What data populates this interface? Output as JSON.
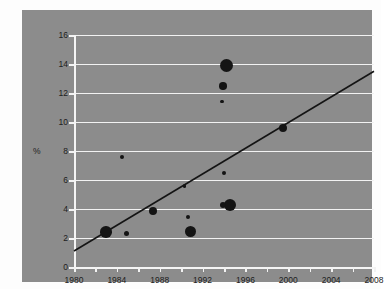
{
  "chart_data": {
    "type": "scatter",
    "title": "",
    "subtitle": "",
    "xlabel": "",
    "ylabel": "%",
    "xlim": [
      1980,
      2008
    ],
    "ylim": [
      0,
      16
    ],
    "xticks": [
      1980,
      1982,
      1984,
      1986,
      1988,
      1990,
      1992,
      1994,
      1996,
      1998,
      2000,
      2002,
      2004,
      2006,
      2008
    ],
    "xtick_labels": [
      "1980",
      "",
      "1984",
      "",
      "1988",
      "",
      "1992",
      "",
      "1996",
      "",
      "2000",
      "",
      "2004",
      "",
      "2008"
    ],
    "yticks": [
      0,
      2,
      4,
      6,
      8,
      10,
      12,
      14,
      16
    ],
    "ytick_labels": [
      "0",
      "2",
      "4",
      "6",
      "8",
      "10",
      "12",
      "14",
      "16"
    ],
    "grid": "horizontal",
    "grid_color": "#f2f2f2",
    "panel_color": "#8c8c8c",
    "marker_color": "#141414",
    "legend": "none",
    "series": [
      {
        "name": "observations",
        "points": [
          {
            "x": 1983.0,
            "y": 2.4,
            "size": 11.5,
            "style": "filled"
          },
          {
            "x": 1984.5,
            "y": 7.6,
            "size": 4.5,
            "style": "filled"
          },
          {
            "x": 1984.9,
            "y": 2.3,
            "size": 5.5,
            "style": "filled"
          },
          {
            "x": 1987.4,
            "y": 3.85,
            "size": 8.0,
            "style": "filled"
          },
          {
            "x": 1990.3,
            "y": 5.6,
            "size": 3.5,
            "style": "filled"
          },
          {
            "x": 1990.6,
            "y": 3.45,
            "size": 4.0,
            "style": "filled"
          },
          {
            "x": 1990.9,
            "y": 2.45,
            "size": 11.0,
            "style": "filled"
          },
          {
            "x": 1994.2,
            "y": 13.9,
            "size": 13.0,
            "style": "filled"
          },
          {
            "x": 1993.9,
            "y": 12.5,
            "size": 7.5,
            "style": "filled"
          },
          {
            "x": 1993.8,
            "y": 11.4,
            "size": 3.5,
            "style": "filled"
          },
          {
            "x": 1994.0,
            "y": 6.5,
            "size": 4.5,
            "style": "filled"
          },
          {
            "x": 1994.6,
            "y": 4.3,
            "size": 12.0,
            "style": "filled"
          },
          {
            "x": 1993.9,
            "y": 4.3,
            "size": 6.0,
            "style": "filled"
          },
          {
            "x": 1999.5,
            "y": 9.6,
            "size": 8.5,
            "style": "filled"
          }
        ]
      }
    ],
    "trendline": {
      "name": "linear-fit",
      "x0": 1980,
      "y0": 1.1,
      "x1": 2008,
      "y1": 13.5,
      "color": "#141414",
      "width": 1.6
    }
  }
}
